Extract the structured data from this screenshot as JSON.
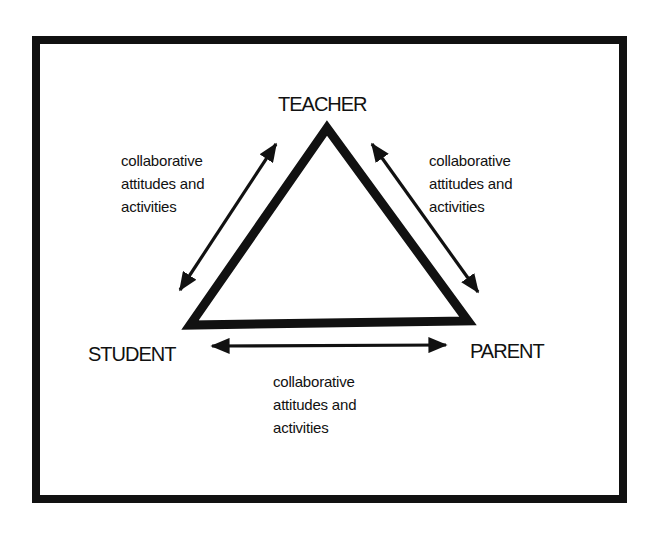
{
  "diagram": {
    "nodes": {
      "teacher": "TEACHER",
      "student": "STUDENT",
      "parent": "PARENT"
    },
    "edges": {
      "teacher_student": {
        "line1": "collaborative",
        "line2": "attitudes and",
        "line3": "activities"
      },
      "teacher_parent": {
        "line1": "collaborative",
        "line2": "attitudes and",
        "line3": "activities"
      },
      "student_parent": {
        "line1": "collaborative",
        "line2": "attitudes and",
        "line3": "activities"
      }
    },
    "colors": {
      "ink": "#111111",
      "background": "#ffffff"
    }
  }
}
